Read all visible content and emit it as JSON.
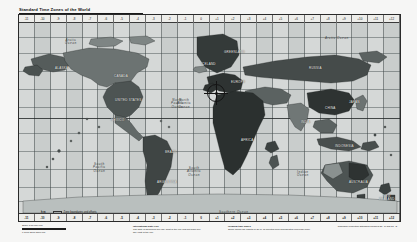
{
  "document": {
    "title": "Standard Time Zones of the World",
    "type": "map-poster",
    "projection_credit": "Robinson Projection\nStandard parallels 38° N and 38° S",
    "scale_label": "Scale 1:80,000,000",
    "scale_ticks": "0            1000          2000          3000 km"
  },
  "rulers": {
    "top_offsets": [
      "-11",
      "-10",
      "-9",
      "-8",
      "-7",
      "-6",
      "-5",
      "-4",
      "-3",
      "-2",
      "-1",
      "0",
      "+1",
      "+2",
      "+3",
      "+4",
      "+5",
      "+6",
      "+7",
      "+8",
      "+9",
      "+10",
      "+11",
      "+12"
    ],
    "bottom_offsets": [
      "-11",
      "-10",
      "-9",
      "-8",
      "-7",
      "-6",
      "-5",
      "-4",
      "-3",
      "-2",
      "-1",
      "0",
      "+1",
      "+2",
      "+3",
      "+4",
      "+5",
      "+6",
      "+7",
      "+8",
      "+9",
      "+10",
      "+11",
      "+12"
    ],
    "top_note": "Standard time = Coordinated Universal Time (UTC) plus or minus the hours shown",
    "bottom_note": "Hours ahead of or behind Coordinated Universal Time"
  },
  "legend": {
    "rows": [
      {
        "key": "h m",
        "value": "Zone boundaries and offsets"
      },
      {
        "key": "+ 3",
        "value": "Hours ahead of UTC"
      },
      {
        "key": "- 5",
        "value": "Hours behind UTC"
      },
      {
        "key": "IDL",
        "value": "International Date Line"
      }
    ]
  },
  "notes": {
    "left": {
      "header": "International Date Line",
      "body": "The date is advanced one day west of the line and set back one day east of the line."
    },
    "right": {
      "header": "Irregular time zones",
      "body": "Some areas use offsets of 30 or 45 minutes from Coordinated Universal Time."
    }
  },
  "ocean_labels": [
    {
      "text": "Arctic\nOcean",
      "x": 46,
      "y": 24
    },
    {
      "text": "Arctic Ocean",
      "x": 306,
      "y": 22
    },
    {
      "text": "North\nPacific\nOcean",
      "x": 152,
      "y": 84
    },
    {
      "text": "North\nAtlantic\nOcean",
      "x": 158,
      "y": 84
    },
    {
      "text": "South\nPacific\nOcean",
      "x": 74,
      "y": 148
    },
    {
      "text": "South\nAtlantic\nOcean",
      "x": 168,
      "y": 152
    },
    {
      "text": "Indian\nOcean",
      "x": 278,
      "y": 156
    },
    {
      "text": "Southern Ocean",
      "x": 200,
      "y": 196
    }
  ],
  "region_labels": [
    {
      "text": "GREENLAND",
      "x": 205,
      "y": 36
    },
    {
      "text": "CANADA",
      "x": 95,
      "y": 60
    },
    {
      "text": "ALASKA",
      "x": 36,
      "y": 52
    },
    {
      "text": "UNITED STATES",
      "x": 96,
      "y": 84
    },
    {
      "text": "MEXICO",
      "x": 92,
      "y": 104
    },
    {
      "text": "BRAZIL",
      "x": 146,
      "y": 136
    },
    {
      "text": "ARGENTINA",
      "x": 138,
      "y": 166
    },
    {
      "text": "ICELAND",
      "x": 182,
      "y": 48
    },
    {
      "text": "EUROPE",
      "x": 212,
      "y": 66
    },
    {
      "text": "RUSSIA",
      "x": 290,
      "y": 52
    },
    {
      "text": "CHINA",
      "x": 306,
      "y": 92
    },
    {
      "text": "INDIA",
      "x": 282,
      "y": 106
    },
    {
      "text": "AFRICA",
      "x": 222,
      "y": 124
    },
    {
      "text": "AUSTRALIA",
      "x": 330,
      "y": 166
    },
    {
      "text": "NEW\nZEALAND",
      "x": 360,
      "y": 180
    },
    {
      "text": "JAPAN",
      "x": 330,
      "y": 86
    },
    {
      "text": "INDONESIA",
      "x": 316,
      "y": 130
    },
    {
      "text": "ANTARCTICA",
      "x": 196,
      "y": 200
    }
  ],
  "marker": {
    "name": "crosshair-reticle",
    "label": "",
    "x": 185,
    "y": 66
  },
  "colors": {
    "sheet": "#f6f6f5",
    "ocean": "#d5d8d7",
    "frame": "#2a2a2a",
    "ruler_bg": "#ededea",
    "land_dark": "#2e3332",
    "land_mid": "#5b6261",
    "land_light": "#9aa0a0",
    "label_light": "#f0f0ee",
    "label_dark": "#1d1d1d"
  }
}
